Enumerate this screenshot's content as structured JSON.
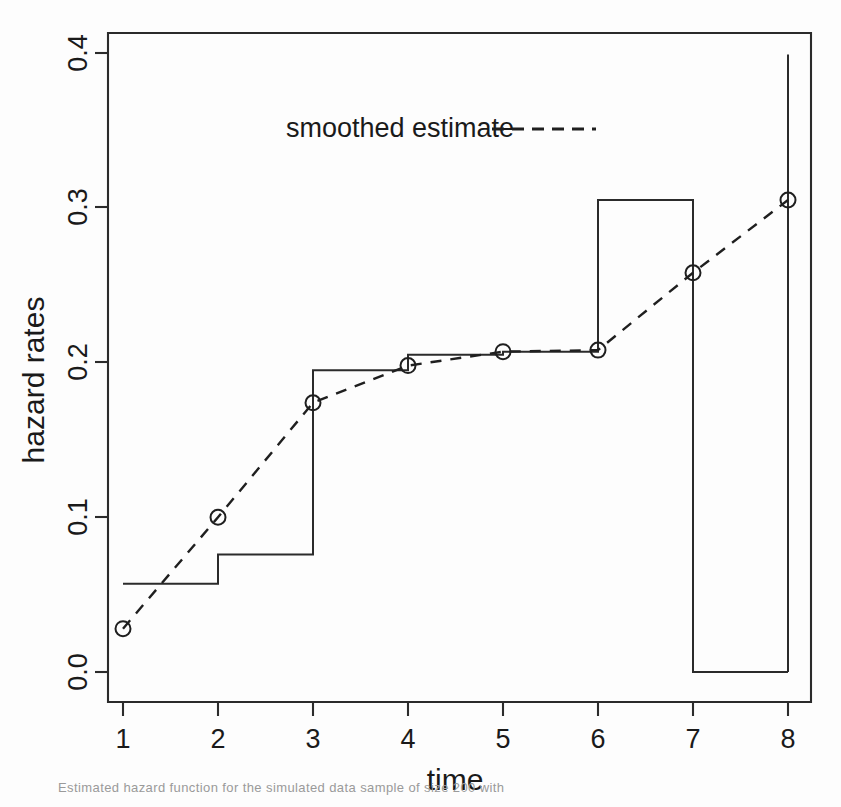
{
  "figure": {
    "background_color": "#ffffff",
    "ink_color": "#2b2b2b"
  },
  "axes": {
    "x_title": "time",
    "y_title": "hazard rates",
    "x_tick_labels": [
      "1",
      "2",
      "3",
      "4",
      "5",
      "6",
      "7",
      "8"
    ],
    "y_tick_labels": [
      "0.0",
      "0.1",
      "0.2",
      "0.3",
      "0.4"
    ]
  },
  "legend": {
    "label": "smoothed estimate",
    "line_style": "dashed"
  },
  "caption": {
    "text": "Estimated hazard function for the simulated data sample of size 200 with"
  },
  "chart_data": {
    "type": "line",
    "title": "",
    "xlabel": "time",
    "ylabel": "hazard rates",
    "xlim": [
      0.52,
      8.48
    ],
    "ylim": [
      -0.012,
      0.412
    ],
    "xticks": [
      1,
      2,
      3,
      4,
      5,
      6,
      7,
      8
    ],
    "yticks": [
      0.0,
      0.1,
      0.2,
      0.3,
      0.4
    ],
    "grid": false,
    "legend_position": "top-center",
    "series": [
      {
        "name": "step estimate",
        "style": "solid-step",
        "x_intervals": [
          [
            1,
            2
          ],
          [
            2,
            3
          ],
          [
            3,
            4
          ],
          [
            4,
            5
          ],
          [
            5,
            6
          ],
          [
            6,
            7
          ],
          [
            7,
            8
          ]
        ],
        "values": [
          0.057,
          0.076,
          0.195,
          0.205,
          0.207,
          0.305,
          0.0
        ],
        "terminal_spike_x": 8,
        "terminal_spike_value": 0.399
      },
      {
        "name": "smoothed estimate",
        "style": "dashed-with-open-circles",
        "x": [
          1,
          2,
          3,
          4,
          5,
          6,
          7,
          8
        ],
        "values": [
          0.028,
          0.1,
          0.174,
          0.198,
          0.207,
          0.208,
          0.258,
          0.305
        ]
      }
    ]
  }
}
